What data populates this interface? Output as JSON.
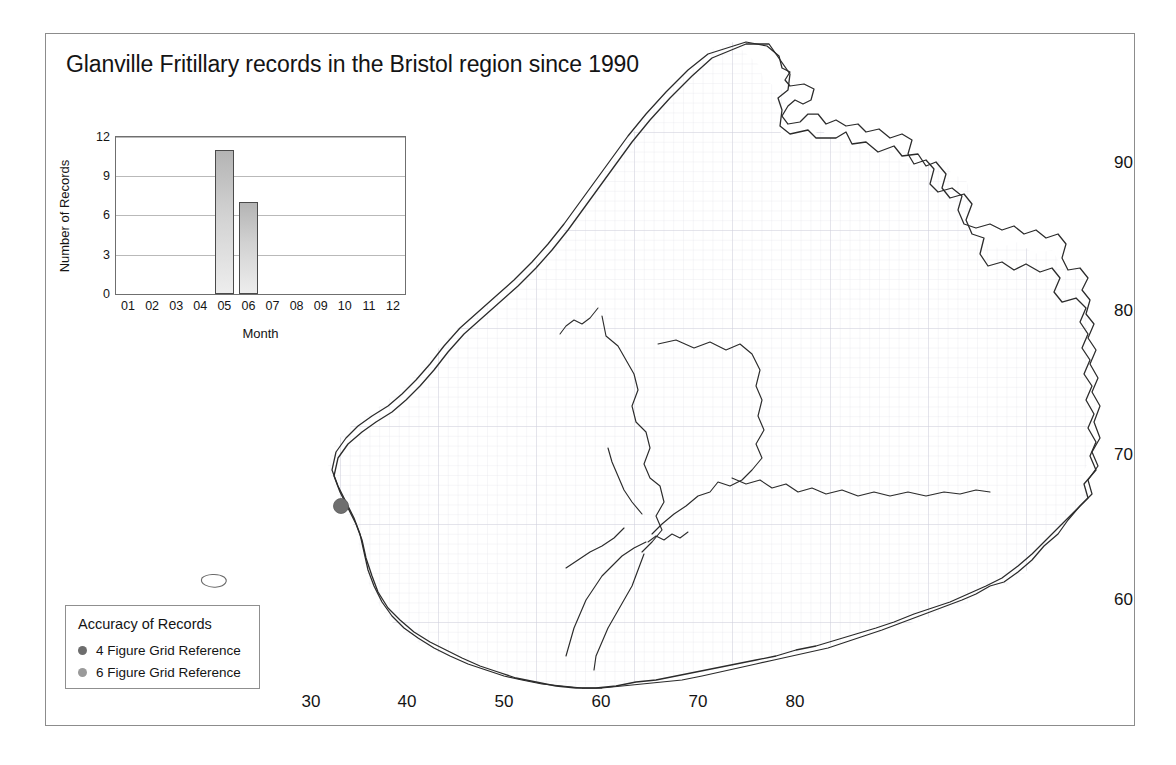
{
  "figure": {
    "title": "Glanville Fritillary records in the Bristol region since 1990",
    "background_color": "#ffffff",
    "frame_color": "#8c8c8c"
  },
  "chart_data": {
    "type": "bar",
    "title": "Glanville Fritillary records in the Bristol region since 1990",
    "xlabel": "Month",
    "ylabel": "Number of Records",
    "categories": [
      "01",
      "02",
      "03",
      "04",
      "05",
      "06",
      "07",
      "08",
      "09",
      "10",
      "11",
      "12"
    ],
    "values": [
      0,
      0,
      0,
      0,
      11,
      7,
      0,
      0,
      0,
      0,
      0,
      0
    ],
    "ylim": [
      0,
      12
    ],
    "yticks": [
      0,
      3,
      6,
      9,
      12
    ],
    "grid": true,
    "legend_position": "none",
    "bar_fill_top": "#b4b4b4",
    "bar_fill_bottom": "#ededed",
    "bar_border": "#4a4a4a"
  },
  "map": {
    "x_axis_ticks": [
      "30",
      "40",
      "50",
      "60",
      "70",
      "80"
    ],
    "y_axis_ticks": [
      "90",
      "80",
      "70",
      "60"
    ],
    "outline_color": "#2b2b2b",
    "grid_color": "#d8d8e2",
    "records": [
      {
        "label": "record-marker-1",
        "x": 340,
        "y": 505,
        "accuracy": "4 Figure Grid Reference",
        "color": "#6f6f6f"
      }
    ]
  },
  "legend": {
    "title": "Accuracy of Records",
    "items": [
      {
        "label": "4 Figure Grid Reference",
        "color": "#6d6d6d"
      },
      {
        "label": "6 Figure Grid Reference",
        "color": "#9a9a9a"
      }
    ]
  }
}
